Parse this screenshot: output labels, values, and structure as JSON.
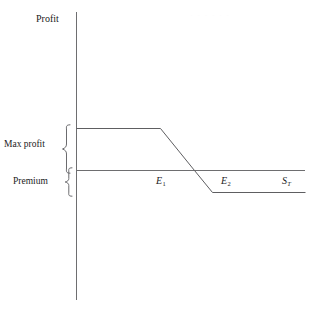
{
  "figure": {
    "background_color": "#ffffff",
    "line_color": "#5e5e61",
    "axis_color": "#6e6e70",
    "text_color": "#1b1b1b"
  },
  "labels": {
    "y_axis": "Profit",
    "max_profit": "Max profit",
    "premium": "Premium",
    "strike_1": "E",
    "strike_1_sub": "1",
    "strike_2": "E",
    "strike_2_sub": "2",
    "underlying": "S",
    "underlying_sub": "T"
  },
  "artifacts": {
    "top_right": "· · · · · ·"
  },
  "chart_data": {
    "type": "line",
    "title": "",
    "subtitle": "",
    "xlabel": "S_T",
    "ylabel": "Profit",
    "grid": false,
    "legend": false,
    "xlim": [
      0,
      229
    ],
    "ylim": [
      -22,
      42
    ],
    "axis_origin_px": {
      "x": 76,
      "y": 170
    },
    "series": [
      {
        "name": "Profit at expiration",
        "points": [
          {
            "x": 0,
            "y": 42,
            "px": [
              76,
              128
            ],
            "note": "max profit level at y-axis"
          },
          {
            "x": 84,
            "y": 42,
            "px": [
              160,
              128
            ],
            "note": "kink at strike E1"
          },
          {
            "x": 118,
            "y": 0,
            "px": [
              194,
              170
            ],
            "note": "break-even, crosses zero profit"
          },
          {
            "x": 136,
            "y": -22,
            "px": [
              212,
              192
            ],
            "note": "kink at strike E2 (max loss)"
          },
          {
            "x": 229,
            "y": -22,
            "px": [
              305,
              192
            ],
            "note": "flat max loss to right edge"
          }
        ]
      }
    ],
    "annotations": [
      {
        "text": "Max profit",
        "type": "brace",
        "span_y": [
          42,
          0
        ],
        "span_px_y": [
          128,
          170
        ],
        "side": "left"
      },
      {
        "text": "Premium",
        "type": "brace",
        "span_y": [
          0,
          -22
        ],
        "span_px_y": [
          170,
          192
        ],
        "side": "left"
      },
      {
        "text": "E1",
        "type": "x-tick-label",
        "x": 84,
        "px": [
          160,
          182
        ]
      },
      {
        "text": "E2",
        "type": "x-tick-label",
        "x": 136,
        "px": [
          225,
          182
        ]
      },
      {
        "text": "ST",
        "type": "axis-name",
        "x": 212,
        "px": [
          285,
          182
        ]
      }
    ],
    "reference_lines": [
      {
        "name": "zero-profit-axis",
        "orientation": "horizontal",
        "y": 0,
        "px_y": 170
      }
    ]
  }
}
